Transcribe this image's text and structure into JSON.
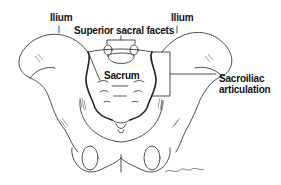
{
  "diagram": {
    "labels": {
      "ilium_left": "Ilium",
      "ilium_right": "Ilium",
      "superior_sacral_facets": "Superior sacral facets",
      "sacrum": "Sacrum",
      "sacroiliac_line1": "Sacroiliac",
      "sacroiliac_line2": "articulation"
    },
    "signature": "artist signature",
    "colors": {
      "line": "#111111",
      "background": "#ffffff",
      "shade": "#555555"
    }
  }
}
